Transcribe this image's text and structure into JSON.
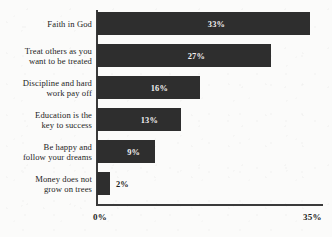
{
  "chart_data": {
    "type": "bar",
    "orientation": "horizontal",
    "title": "",
    "xlabel": "",
    "ylabel": "",
    "xlim": [
      0,
      35
    ],
    "grid": false,
    "legend": null,
    "bar_color": "#2e2e2e",
    "background_color": "#fbfbfa",
    "categories": [
      "Faith in God",
      "Treat others as you\nwant to be treated",
      "Discipline and hard\nwork pay off",
      "Education is the\nkey to success",
      "Be happy and\nfollow your dreams",
      "Money does not\ngrow on trees"
    ],
    "values": [
      33,
      27,
      16,
      13,
      9,
      2
    ],
    "value_labels": [
      "33%",
      "27%",
      "16%",
      "13%",
      "9%",
      "2%"
    ],
    "value_label_placement": [
      "inside",
      "inside",
      "inside",
      "inside",
      "inside",
      "outside"
    ],
    "xticks": [
      0,
      35
    ],
    "xtick_labels": [
      "0%",
      "35%"
    ]
  },
  "axis": {
    "tick_start": "0%",
    "tick_end": "35%"
  }
}
